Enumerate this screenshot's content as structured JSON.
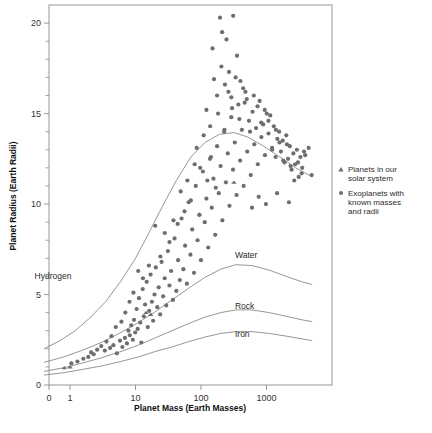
{
  "chart_data": {
    "type": "scatter",
    "title": "",
    "xlabel": "Planet Mass (Earth Masses)",
    "ylabel": "Planet Radius (Earth Radii)",
    "xscale": "log",
    "yscale": "linear",
    "xlim": [
      0.35,
      6000
    ],
    "ylim": [
      0,
      21
    ],
    "xticks": [
      "0",
      "1",
      "10",
      "100",
      "1000"
    ],
    "xtick_values": [
      0.35,
      1,
      10,
      100,
      1000
    ],
    "yticks": [
      "0",
      "5",
      "10",
      "15",
      "20"
    ],
    "ytick_values": [
      0,
      5,
      10,
      15,
      20
    ],
    "yminor_step": 1,
    "grid": false,
    "marker_color": "#6e6e6e",
    "curve_color": "#8a8a8a",
    "axis_color": "#8d8d8d",
    "legend": {
      "position": "right",
      "entries": [
        {
          "marker": "triangle",
          "label_line1": "Planets in our",
          "label_line2": "solar system",
          "label": "Planets in our solar system"
        },
        {
          "marker": "circle",
          "label_line1": "Exoplanets with",
          "label_line2": "known masses",
          "label_line3": "and radii",
          "label": "Exoplanets with known masses and radii"
        }
      ]
    },
    "curves": [
      {
        "name": "Hydrogen",
        "label_x": 1.05,
        "label_y": 5.85,
        "points": [
          [
            0.4,
            2.0
          ],
          [
            0.7,
            2.45
          ],
          [
            1.2,
            3.0
          ],
          [
            2,
            3.7
          ],
          [
            3.5,
            4.6
          ],
          [
            6,
            5.75
          ],
          [
            10,
            7.0
          ],
          [
            16,
            8.4
          ],
          [
            26,
            9.9
          ],
          [
            42,
            11.3
          ],
          [
            70,
            12.6
          ],
          [
            115,
            13.4
          ],
          [
            190,
            13.85
          ],
          [
            320,
            13.95
          ],
          [
            520,
            13.7
          ],
          [
            900,
            13.2
          ],
          [
            1600,
            12.6
          ],
          [
            2800,
            12.0
          ],
          [
            5000,
            11.5
          ]
        ]
      },
      {
        "name": "Water",
        "label_x": 330,
        "label_y": 7.0,
        "points": [
          [
            0.4,
            1.25
          ],
          [
            0.8,
            1.55
          ],
          [
            1.5,
            1.9
          ],
          [
            3,
            2.35
          ],
          [
            6,
            2.9
          ],
          [
            11,
            3.45
          ],
          [
            20,
            4.05
          ],
          [
            36,
            4.7
          ],
          [
            65,
            5.35
          ],
          [
            115,
            5.95
          ],
          [
            200,
            6.4
          ],
          [
            340,
            6.65
          ],
          [
            600,
            6.6
          ],
          [
            1100,
            6.35
          ],
          [
            2000,
            6.0
          ],
          [
            3500,
            5.7
          ],
          [
            5000,
            5.55
          ]
        ]
      },
      {
        "name": "Rock",
        "label_x": 330,
        "label_y": 4.2,
        "points": [
          [
            0.4,
            0.75
          ],
          [
            0.8,
            0.95
          ],
          [
            1.5,
            1.2
          ],
          [
            3,
            1.5
          ],
          [
            6,
            1.85
          ],
          [
            11,
            2.2
          ],
          [
            20,
            2.6
          ],
          [
            36,
            3.0
          ],
          [
            65,
            3.4
          ],
          [
            115,
            3.75
          ],
          [
            200,
            4.0
          ],
          [
            340,
            4.15
          ],
          [
            600,
            4.15
          ],
          [
            1100,
            4.0
          ],
          [
            2000,
            3.8
          ],
          [
            3500,
            3.6
          ],
          [
            5000,
            3.5
          ]
        ]
      },
      {
        "name": "Iron",
        "label_x": 330,
        "label_y": 2.65,
        "points": [
          [
            0.4,
            0.55
          ],
          [
            0.8,
            0.68
          ],
          [
            1.5,
            0.85
          ],
          [
            3,
            1.05
          ],
          [
            6,
            1.3
          ],
          [
            11,
            1.55
          ],
          [
            20,
            1.85
          ],
          [
            36,
            2.1
          ],
          [
            65,
            2.4
          ],
          [
            115,
            2.65
          ],
          [
            200,
            2.85
          ],
          [
            340,
            2.95
          ],
          [
            600,
            2.95
          ],
          [
            1100,
            2.85
          ],
          [
            2000,
            2.7
          ],
          [
            3500,
            2.55
          ],
          [
            5000,
            2.45
          ]
        ]
      }
    ],
    "series": [
      {
        "name": "Planets in our solar system",
        "marker": "triangle",
        "points": [
          [
            0.82,
            0.95
          ],
          [
            1.0,
            1.0
          ],
          [
            14.5,
            4.0
          ],
          [
            17.1,
            3.9
          ],
          [
            95,
            9.45
          ],
          [
            318,
            11.2
          ]
        ]
      },
      {
        "name": "Exoplanets with known masses and radii",
        "marker": "circle",
        "points": [
          [
            1.9,
            1.55
          ],
          [
            2.3,
            1.7
          ],
          [
            3.4,
            1.9
          ],
          [
            4.1,
            2.05
          ],
          [
            4.6,
            2.2
          ],
          [
            5.2,
            1.75
          ],
          [
            5.8,
            2.45
          ],
          [
            6.3,
            2.1
          ],
          [
            6.9,
            2.6
          ],
          [
            7.4,
            2.3
          ],
          [
            7.8,
            3.0
          ],
          [
            8.2,
            2.75
          ],
          [
            8.6,
            3.3
          ],
          [
            9.1,
            2.5
          ],
          [
            9.5,
            3.6
          ],
          [
            9.9,
            2.9
          ],
          [
            10.4,
            4.2
          ],
          [
            10.8,
            3.1
          ],
          [
            11.3,
            4.8
          ],
          [
            11.8,
            3.45
          ],
          [
            12.3,
            2.35
          ],
          [
            12.9,
            5.3
          ],
          [
            13.4,
            3.8
          ],
          [
            14.0,
            4.45
          ],
          [
            14.8,
            5.7
          ],
          [
            15.4,
            3.2
          ],
          [
            16.2,
            4.1
          ],
          [
            17.0,
            6.1
          ],
          [
            17.8,
            4.6
          ],
          [
            18.6,
            3.55
          ],
          [
            19.5,
            5.0
          ],
          [
            20.4,
            6.5
          ],
          [
            21.5,
            4.3
          ],
          [
            22.6,
            5.4
          ],
          [
            23.8,
            3.9
          ],
          [
            25.0,
            6.8
          ],
          [
            26.4,
            4.9
          ],
          [
            27.9,
            5.9
          ],
          [
            29.5,
            4.4
          ],
          [
            31.2,
            7.4
          ],
          [
            33.0,
            5.5
          ],
          [
            35.0,
            6.3
          ],
          [
            37.2,
            4.7
          ],
          [
            39.5,
            8.1
          ],
          [
            42.0,
            5.2
          ],
          [
            44.7,
            6.9
          ],
          [
            47.5,
            5.8
          ],
          [
            50.5,
            9.2
          ],
          [
            53.8,
            6.4
          ],
          [
            57.2,
            7.7
          ],
          [
            60.9,
            5.6
          ],
          [
            64.8,
            10.1
          ],
          [
            69.0,
            7.2
          ],
          [
            73.4,
            8.6
          ],
          [
            78.2,
            6.2
          ],
          [
            83.2,
            11.0
          ],
          [
            88.6,
            8.0
          ],
          [
            94.3,
            9.4
          ],
          [
            100,
            6.9
          ],
          [
            107,
            11.8
          ],
          [
            114,
            9.0
          ],
          [
            121,
            10.3
          ],
          [
            129,
            7.6
          ],
          [
            137,
            12.5
          ],
          [
            146,
            9.8
          ],
          [
            155,
            11.4
          ],
          [
            165,
            8.3
          ],
          [
            176,
            13.2
          ],
          [
            187,
            10.6
          ],
          [
            199,
            12.1
          ],
          [
            212,
            9.1
          ],
          [
            226,
            14.0
          ],
          [
            240,
            11.2
          ],
          [
            256,
            12.8
          ],
          [
            272,
            9.9
          ],
          [
            290,
            14.8
          ],
          [
            308,
            11.9
          ],
          [
            328,
            13.4
          ],
          [
            349,
            10.5
          ],
          [
            372,
            15.5
          ],
          [
            396,
            12.4
          ],
          [
            421,
            14.1
          ],
          [
            448,
            11.0
          ],
          [
            477,
            16.2
          ],
          [
            508,
            12.9
          ],
          [
            540,
            14.6
          ],
          [
            575,
            11.6
          ],
          [
            612,
            15.1
          ],
          [
            651,
            13.3
          ],
          [
            693,
            14.2
          ],
          [
            738,
            12.2
          ],
          [
            785,
            15.7
          ],
          [
            836,
            13.7
          ],
          [
            890,
            14.4
          ],
          [
            947,
            12.7
          ],
          [
            1008,
            15.0
          ],
          [
            1073,
            13.9
          ],
          [
            1142,
            14.9
          ],
          [
            1216,
            13.1
          ],
          [
            1294,
            14.3
          ],
          [
            1377,
            12.6
          ],
          [
            1466,
            13.6
          ],
          [
            1560,
            14.0
          ],
          [
            1660,
            12.9
          ],
          [
            1767,
            13.5
          ],
          [
            1881,
            12.3
          ],
          [
            2002,
            13.8
          ],
          [
            2131,
            12.5
          ],
          [
            2268,
            13.2
          ],
          [
            2414,
            11.9
          ],
          [
            2570,
            12.8
          ],
          [
            2735,
            12.2
          ],
          [
            2911,
            13.0
          ],
          [
            3098,
            11.5
          ],
          [
            3298,
            12.6
          ],
          [
            3510,
            12.0
          ],
          [
            3736,
            12.9
          ],
          [
            150,
            18.6
          ],
          [
            195,
            20.3
          ],
          [
            210,
            19.5
          ],
          [
            245,
            19.1
          ],
          [
            268,
            17.3
          ],
          [
            310,
            20.4
          ],
          [
            176,
            16.0
          ],
          [
            232,
            16.6
          ],
          [
            290,
            15.9
          ],
          [
            355,
            18.2
          ],
          [
            400,
            16.8
          ],
          [
            465,
            15.6
          ],
          [
            121,
            15.2
          ],
          [
            138,
            14.3
          ],
          [
            158,
            16.9
          ],
          [
            182,
            15.0
          ],
          [
            205,
            17.6
          ],
          [
            228,
            14.1
          ],
          [
            262,
            16.2
          ],
          [
            298,
            15.3
          ],
          [
            338,
            17.0
          ],
          [
            385,
            14.7
          ],
          [
            440,
            16.4
          ],
          [
            500,
            15.8
          ],
          [
            560,
            14.0
          ],
          [
            640,
            16.0
          ],
          [
            730,
            15.4
          ],
          [
            830,
            14.5
          ],
          [
            940,
            15.2
          ],
          [
            1070,
            14.6
          ],
          [
            1220,
            13.0
          ],
          [
            1390,
            14.1
          ],
          [
            1580,
            13.4
          ],
          [
            1800,
            12.4
          ],
          [
            2050,
            13.3
          ],
          [
            2330,
            12.1
          ],
          [
            2650,
            11.3
          ],
          [
            3020,
            12.3
          ],
          [
            3440,
            11.7
          ],
          [
            3900,
            12.7
          ],
          [
            4400,
            13.1
          ],
          [
            4900,
            11.6
          ],
          [
            86,
            13.1
          ],
          [
            97,
            12.0
          ],
          [
            110,
            13.8
          ],
          [
            125,
            11.3
          ],
          [
            142,
            12.6
          ],
          [
            168,
            10.9
          ],
          [
            62,
            11.3
          ],
          [
            70,
            10.2
          ],
          [
            80,
            12.2
          ],
          [
            56,
            9.6
          ],
          [
            49,
            10.7
          ],
          [
            44,
            8.9
          ],
          [
            600,
            9.8
          ],
          [
            760,
            10.4
          ],
          [
            980,
            10.0
          ],
          [
            1450,
            10.6
          ],
          [
            2200,
            10.1
          ],
          [
            33,
            7.9
          ],
          [
            38,
            9.1
          ],
          [
            28,
            8.4
          ],
          [
            24,
            7.1
          ],
          [
            20,
            8.8
          ],
          [
            16,
            6.6
          ],
          [
            13,
            5.9
          ],
          [
            11,
            6.3
          ],
          [
            9.3,
            5.1
          ],
          [
            8.1,
            4.6
          ],
          [
            7.0,
            4.0
          ],
          [
            6.1,
            3.5
          ],
          [
            5.0,
            3.2
          ],
          [
            4.3,
            2.7
          ],
          [
            3.6,
            2.4
          ],
          [
            3.0,
            2.15
          ],
          [
            2.6,
            1.95
          ],
          [
            2.1,
            1.8
          ],
          [
            1.6,
            1.45
          ],
          [
            1.3,
            1.3
          ],
          [
            1.05,
            1.2
          ]
        ]
      }
    ]
  }
}
